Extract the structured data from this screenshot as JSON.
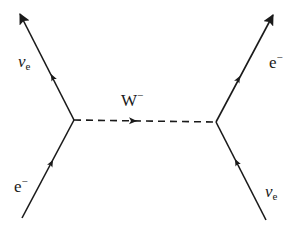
{
  "diagram": {
    "colors": {
      "line": "#1a1a1a",
      "background": "#ffffff"
    },
    "vertices": [
      {
        "id": "left",
        "x": 74,
        "y": 120
      },
      {
        "id": "right",
        "x": 216,
        "y": 122
      }
    ],
    "lines": [
      {
        "id": "nu-e-out-left",
        "from": [
          74,
          120
        ],
        "to": [
          20,
          14
        ],
        "style": "solid",
        "arrow": "end"
      },
      {
        "id": "e-in-left",
        "from": [
          22,
          218
        ],
        "to": [
          74,
          120
        ],
        "style": "solid",
        "arrow": "mid"
      },
      {
        "id": "w-boson",
        "from": [
          74,
          120
        ],
        "to": [
          216,
          122
        ],
        "style": "dashed",
        "arrow": "mid"
      },
      {
        "id": "e-out-right",
        "from": [
          216,
          122
        ],
        "to": [
          273,
          15
        ],
        "style": "solid",
        "arrow": "end"
      },
      {
        "id": "nu-e-in-right",
        "from": [
          266,
          220
        ],
        "to": [
          216,
          122
        ],
        "style": "solid",
        "arrow": "mid"
      }
    ],
    "labels": {
      "nu_top_left": {
        "main": "ν",
        "sub": "e"
      },
      "e_bottom_left": {
        "main": "e",
        "sup": "−"
      },
      "w_boson": {
        "main": "W",
        "sup": "−"
      },
      "e_top_right": {
        "main": "e",
        "sup": "−"
      },
      "nu_bottom_right": {
        "main": "ν",
        "sub": "e"
      }
    }
  }
}
